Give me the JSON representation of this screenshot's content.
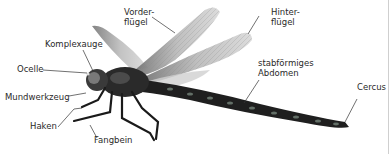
{
  "figure": {
    "labels": {
      "vorderfluegel_1": "Vorder-",
      "vorderfluegel_2": "flügel",
      "hinterfluegel_1": "Hinter-",
      "hinterfluegel_2": "flügel",
      "komplexauge": "Komplexauge",
      "ocelle": "Ocelle",
      "mundwerkzeug": "Mundwerkzeug",
      "haken": "Haken",
      "fangbein": "Fangbein",
      "abdomen_1": "stabförmiges",
      "abdomen_2": "Abdomen",
      "cercus": "Cercus"
    },
    "colors": {
      "line": "#333333",
      "text": "#2a2a2a",
      "body": "#1c1c1c",
      "wing": "#bdbdbd"
    }
  }
}
